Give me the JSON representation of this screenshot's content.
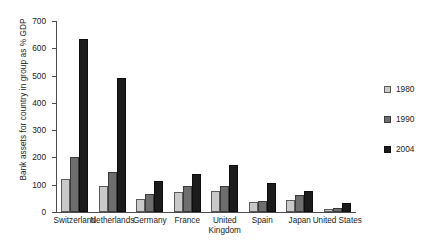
{
  "chart_data": {
    "type": "bar",
    "title": "",
    "subtitle": "",
    "xlabel": "",
    "ylabel": "Bank assets for country in group as % GDP",
    "ylim": [
      0,
      700
    ],
    "yticks": [
      0,
      100,
      200,
      300,
      400,
      500,
      600,
      700
    ],
    "ytick_labels": [
      "0",
      "100",
      "200",
      "300",
      "400",
      "500",
      "600",
      "700"
    ],
    "grid": false,
    "legend_position": "right",
    "categories": [
      "Switzerland",
      "Netherlands",
      "Germany",
      "France",
      "United\nKingdom",
      "Spain",
      "Japan",
      "United States"
    ],
    "series": [
      {
        "name": "1980",
        "color": "#c9c9c9",
        "values": [
          120,
          95,
          48,
          73,
          77,
          37,
          45,
          12
        ]
      },
      {
        "name": "1990",
        "color": "#6e6e6e",
        "values": [
          200,
          148,
          66,
          95,
          95,
          42,
          62,
          15
        ]
      },
      {
        "name": "2004",
        "color": "#1c1c1c",
        "values": [
          635,
          490,
          114,
          139,
          172,
          105,
          77,
          32
        ]
      }
    ]
  },
  "legend": {
    "items": [
      {
        "label": "1980",
        "color": "#c9c9c9"
      },
      {
        "label": "1990",
        "color": "#6e6e6e"
      },
      {
        "label": "2004",
        "color": "#1c1c1c"
      }
    ]
  }
}
